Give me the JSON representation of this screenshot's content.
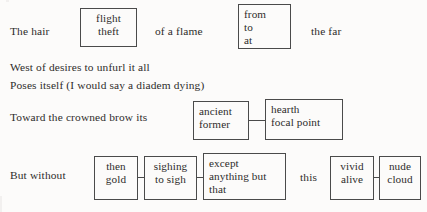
{
  "page": {
    "background_color": "#fcfbfa",
    "ink_color": "#2e2c2b",
    "box_border_color": "#4a4a4a"
  },
  "stanza": {
    "line1": {
      "seg1": "The hair",
      "box1": {
        "l1": "flight",
        "l2": "theft"
      },
      "seg2": "of a flame",
      "box2": {
        "l1": "from",
        "l2": "to",
        "l3": "at"
      },
      "seg3": "the far"
    },
    "line2": "West of desires to unfurl it all",
    "line3": "Poses itself (I would say a diadem dying)",
    "line4": {
      "seg1": "Toward the crowned brow its",
      "box1": {
        "l1": "ancient",
        "l2": "former"
      },
      "box2": {
        "l1": "hearth",
        "l2": "focal point"
      }
    },
    "line5": {
      "seg1": "But without",
      "box1": {
        "l1": "then",
        "l2": "gold"
      },
      "box2": {
        "l1": "sighing",
        "l2": "to sigh"
      },
      "box3": {
        "l1": "except",
        "l2": "anything but",
        "l3": "that"
      },
      "seg2": "this",
      "box4": {
        "l1": "vivid",
        "l2": "alive"
      },
      "box5": {
        "l1": "nude",
        "l2": "cloud"
      }
    }
  }
}
